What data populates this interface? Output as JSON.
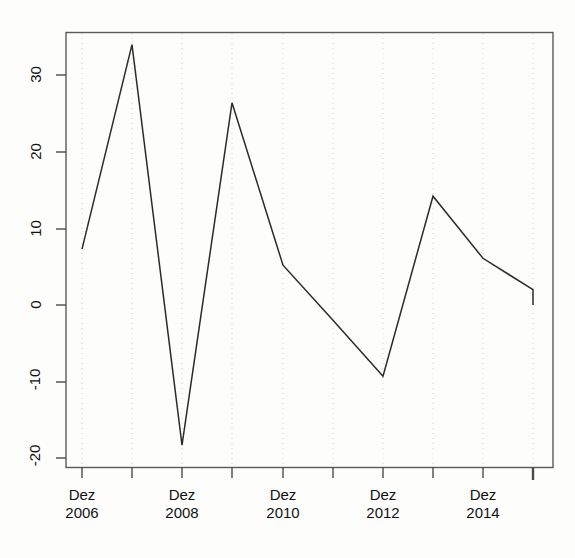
{
  "figure": {
    "title": "",
    "background_color": "#fdfdfc",
    "line_color": "#2b2b2b",
    "axis_color": "#555555",
    "grid_color": "#d8d4d4"
  },
  "chart_data": {
    "type": "line",
    "title": "",
    "xlabel": "",
    "ylabel": "",
    "x": [
      "Dez 2006",
      "Dez 2007",
      "Dez 2008",
      "Dez 2009",
      "Dez 2010",
      "Dez 2011",
      "Dez 2012",
      "Dez 2013",
      "Dez 2014",
      "Dez 2015"
    ],
    "values": [
      7.3,
      34.0,
      -18.3,
      26.4,
      5.2,
      -2.0,
      -9.3,
      14.2,
      6.1,
      2.0
    ],
    "ylim": [
      -22,
      35
    ],
    "xlim": [
      2006,
      2015.2
    ],
    "yticks": [
      30,
      20,
      10,
      0,
      -10,
      -20
    ],
    "ytick_labels": [
      "30",
      "20",
      "10",
      "0",
      "-10",
      "-20"
    ],
    "xticks": [
      2006,
      2007,
      2008,
      2009,
      2010,
      2011,
      2012,
      2013,
      2014,
      2015
    ],
    "xtick_labels": [
      {
        "month": "Dez",
        "year": "2006",
        "tick": 2006,
        "labeled": true
      },
      {
        "month": "",
        "year": "",
        "tick": 2007,
        "labeled": false
      },
      {
        "month": "Dez",
        "year": "2008",
        "tick": 2008,
        "labeled": true
      },
      {
        "month": "",
        "year": "",
        "tick": 2009,
        "labeled": false
      },
      {
        "month": "Dez",
        "year": "2010",
        "tick": 2010,
        "labeled": true
      },
      {
        "month": "",
        "year": "",
        "tick": 2011,
        "labeled": false
      },
      {
        "month": "Dez",
        "year": "2012",
        "tick": 2012,
        "labeled": true
      },
      {
        "month": "",
        "year": "",
        "tick": 2013,
        "labeled": false
      },
      {
        "month": "Dez",
        "year": "2014",
        "tick": 2014,
        "labeled": true
      },
      {
        "month": "",
        "year": "",
        "tick": 2015,
        "labeled": false
      }
    ],
    "grid": {
      "vertical": true,
      "horizontal": false,
      "style": "dotted"
    },
    "legend": null,
    "box": true,
    "series_name": ""
  },
  "yaxis": {
    "labels": [
      "30",
      "20",
      "10",
      "0",
      "-10",
      "-20"
    ]
  },
  "xaxis": {
    "labels": [
      {
        "month": "Dez",
        "year": "2006"
      },
      {
        "month": "Dez",
        "year": "2008"
      },
      {
        "month": "Dez",
        "year": "2010"
      },
      {
        "month": "Dez",
        "year": "2012"
      },
      {
        "month": "Dez",
        "year": "2014"
      }
    ]
  }
}
